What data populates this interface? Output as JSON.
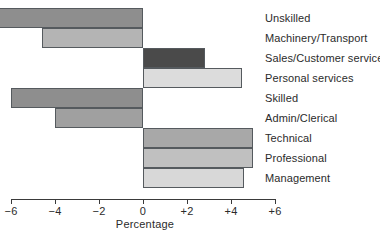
{
  "chart_data": {
    "type": "bar",
    "orientation": "horizontal",
    "title": "",
    "xlabel": "Percentage",
    "ylabel": "",
    "xlim": [
      -6,
      6
    ],
    "xticks": [
      -6,
      -4,
      -2,
      0,
      2,
      4,
      6
    ],
    "xtick_labels": [
      "−6",
      "−4",
      "−2",
      "0",
      "+2",
      "+4",
      "+6"
    ],
    "grid": false,
    "legend": false,
    "zero_line": 0,
    "categories": [
      "Unskilled",
      "Machinery/Transport",
      "Sales/Customer service",
      "Personal services",
      "Skilled",
      "Admin/Clerical",
      "Technical",
      "Professional",
      "Management"
    ],
    "values": [
      -7.5,
      -4.6,
      2.8,
      4.5,
      -6.0,
      -4.0,
      5.0,
      5.0,
      4.6
    ],
    "bar_colors": [
      "#8e8e8e",
      "#b4b4b4",
      "#4a4a4a",
      "#dcdcdc",
      "#8e8e8e",
      "#a0a0a0",
      "#a8a8a8",
      "#c0c0c0",
      "#d8d8d8"
    ],
    "bar_border_color": "#555a5e",
    "axis_color": "#3a3a3a",
    "text_color": "#2b2b2b",
    "background": "#ffffff"
  }
}
